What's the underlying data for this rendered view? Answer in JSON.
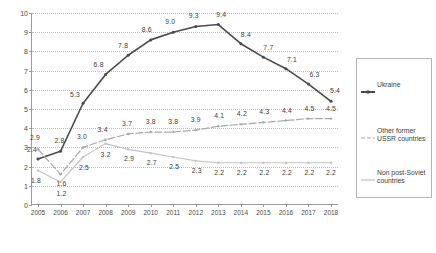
{
  "chart_data": {
    "type": "line",
    "title": "",
    "xlabel": "",
    "ylabel": "",
    "categories": [
      "2005",
      "2006",
      "2007",
      "2008",
      "2009",
      "2010",
      "2011",
      "2012",
      "2013",
      "2014",
      "2015",
      "2016",
      "2017",
      "2018"
    ],
    "ylim": [
      0,
      10
    ],
    "ytick_labels": [
      "0",
      "1",
      "2",
      "3",
      "4",
      "5",
      "6",
      "7",
      "8",
      "9",
      "10"
    ],
    "ytick_values": [
      0,
      1,
      2,
      3,
      4,
      5,
      6,
      7,
      8,
      9,
      10
    ],
    "grid": true,
    "legend_position": "right",
    "series": [
      {
        "name": "Ukraine",
        "color": "#4a4a4a",
        "style": "solid",
        "values": [
          2.4,
          2.8,
          5.3,
          6.8,
          7.8,
          8.6,
          9.0,
          9.3,
          9.4,
          8.4,
          7.7,
          7.1,
          6.3,
          5.4
        ],
        "labels": [
          "2.4",
          "2.8",
          "5.3",
          "6.8",
          "7.8",
          "8.6",
          "9.0",
          "9.3",
          "9.4",
          "8.4",
          "7.7",
          "7.1",
          "6.3",
          "5.4"
        ]
      },
      {
        "name": "Other former USSR countries",
        "color": "#a8a8a8",
        "style": "dashed",
        "values": [
          2.9,
          1.6,
          3.0,
          3.4,
          3.7,
          3.8,
          3.8,
          3.9,
          4.1,
          4.2,
          4.3,
          4.4,
          4.5,
          4.5
        ],
        "labels": [
          "2.9",
          "1.6",
          "3.0",
          "3.4",
          "3.7",
          "3.8",
          "3.8",
          "3.9",
          "4.1",
          "4.2",
          "4.3",
          "4.4",
          "4.5",
          "4.5"
        ]
      },
      {
        "name": "Non post-Soviet countries",
        "color": "#c4c4c4",
        "style": "solid",
        "values": [
          1.8,
          1.2,
          2.5,
          3.2,
          2.9,
          2.7,
          2.5,
          2.3,
          2.2,
          2.2,
          2.2,
          2.2,
          2.2,
          2.2
        ],
        "labels": [
          "1.8",
          "1.2",
          "2.5",
          "3.2",
          "2.9",
          "2.7",
          "2.5",
          "2.3",
          "2.2",
          "2.2",
          "2.2",
          "2.2",
          "2.2",
          "2.2"
        ]
      }
    ],
    "label_offsets": {
      "Ukraine": [
        {
          "dx": -6,
          "dy": -9
        },
        {
          "dx": -1,
          "dy": -10
        },
        {
          "dx": -8,
          "dy": -8
        },
        {
          "dx": -7,
          "dy": -9
        },
        {
          "dx": -5,
          "dy": -9
        },
        {
          "dx": -4,
          "dy": -10
        },
        {
          "dx": -3,
          "dy": -10
        },
        {
          "dx": -2,
          "dy": -10
        },
        {
          "dx": 3,
          "dy": -10
        },
        {
          "dx": 5,
          "dy": -9
        },
        {
          "dx": 5,
          "dy": -9
        },
        {
          "dx": 6,
          "dy": -9
        },
        {
          "dx": 6,
          "dy": -9
        },
        {
          "dx": 4,
          "dy": -10
        }
      ],
      "Other former USSR countries": [
        {
          "dx": -3,
          "dy": -11
        },
        {
          "dx": 1,
          "dy": 10
        },
        {
          "dx": -1,
          "dy": -10
        },
        {
          "dx": -3,
          "dy": -10
        },
        {
          "dx": -1,
          "dy": -10
        },
        {
          "dx": 0,
          "dy": -10
        },
        {
          "dx": 0,
          "dy": -10
        },
        {
          "dx": 0,
          "dy": -10
        },
        {
          "dx": 1,
          "dy": -10
        },
        {
          "dx": 1,
          "dy": -10
        },
        {
          "dx": 1,
          "dy": -10
        },
        {
          "dx": 1,
          "dy": -10
        },
        {
          "dx": 1,
          "dy": -10
        },
        {
          "dx": 0,
          "dy": -10
        }
      ],
      "Non post-Soviet countries": [
        {
          "dx": -2,
          "dy": 11
        },
        {
          "dx": 1,
          "dy": 12
        },
        {
          "dx": 1,
          "dy": 11
        },
        {
          "dx": 0,
          "dy": 11
        },
        {
          "dx": 1,
          "dy": 10
        },
        {
          "dx": 1,
          "dy": 10
        },
        {
          "dx": 1,
          "dy": 10
        },
        {
          "dx": 1,
          "dy": 10
        },
        {
          "dx": 1,
          "dy": 10
        },
        {
          "dx": 1,
          "dy": 10
        },
        {
          "dx": 1,
          "dy": 10
        },
        {
          "dx": 1,
          "dy": 10
        },
        {
          "dx": 1,
          "dy": 10
        },
        {
          "dx": 0,
          "dy": 10
        }
      ]
    }
  },
  "legend": {
    "entries": [
      {
        "label": "Ukraine",
        "color": "#4a4a4a",
        "style": "solid"
      },
      {
        "label": "Other former USSR countries",
        "color": "#a8a8a8",
        "style": "dashed"
      },
      {
        "label": "Non post-Soviet countries",
        "color": "#c4c4c4",
        "style": "solid"
      }
    ]
  }
}
